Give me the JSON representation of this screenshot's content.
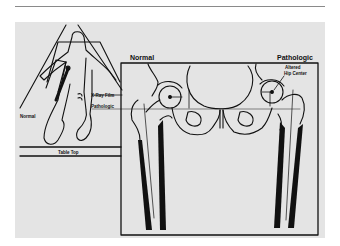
{
  "figure": {
    "labels": {
      "normal_left": "Normal",
      "xray_film": "X-Ray Film",
      "pathologic_left": "Pathologic",
      "table_top": "Table Top",
      "normal_right": "Normal",
      "pathologic_right": "Pathologic",
      "altered_hip_center_line1": "Altered",
      "altered_hip_center_line2": "Hip Center"
    },
    "colors": {
      "panel": "#e4e4e4",
      "ink": "#111111",
      "rule": "#8a8a8a"
    }
  }
}
